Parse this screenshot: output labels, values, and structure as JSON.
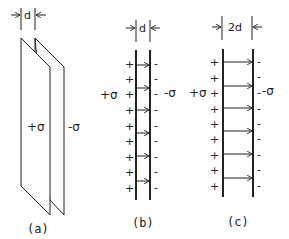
{
  "figure": {
    "panels": [
      {
        "id": "a",
        "caption": "(a)",
        "gap_label": "d",
        "left_plate_label": "+σ",
        "right_plate_label": "-σ",
        "view": "perspective"
      },
      {
        "id": "b",
        "caption": "(b)",
        "gap_label": "d",
        "left_plate_label": "+σ",
        "right_plate_label": "-σ",
        "plus_sign": "+",
        "minus_sign": "-",
        "charge_count": 9,
        "field_arrow_count": 6,
        "view": "edge-on"
      },
      {
        "id": "c",
        "caption": "(c)",
        "gap_label": "2d",
        "left_plate_label": "+σ",
        "right_plate_label": "-σ",
        "plus_sign": "+",
        "minus_sign": "-",
        "charge_count": 9,
        "field_arrow_count": 6,
        "view": "edge-on"
      }
    ],
    "colors": {
      "ink": "#222222",
      "background": "#ffffff"
    }
  }
}
